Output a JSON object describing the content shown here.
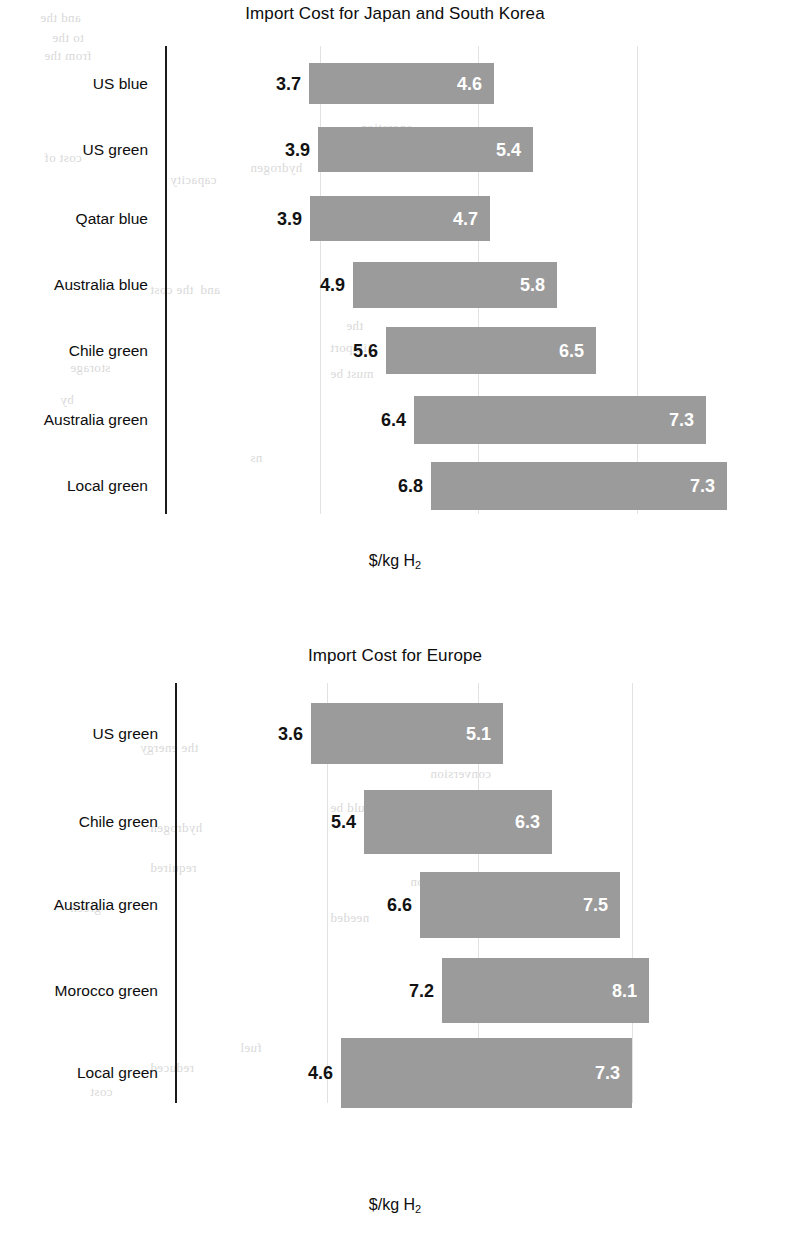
{
  "page": {
    "background_color": "#ffffff",
    "bar_color": "#9b9b9b",
    "axis_color": "#1a1a1a",
    "gridline_color": "#e2e2e2",
    "low_label_color": "#121212",
    "high_label_color": "#ffffff"
  },
  "charts": [
    {
      "title": "Import Cost for Japan and South Korea",
      "xlabel_prefix": "$/kg H",
      "xlabel_sub": "2",
      "categories": [
        "US blue",
        "US green",
        "Qatar blue",
        "Australia blue",
        "Chile green",
        "Australia green",
        "Local green"
      ],
      "low_labels": [
        "3.7",
        "3.9",
        "3.9",
        "4.9",
        "5.6",
        "6.4",
        "6.8"
      ],
      "high_labels": [
        "4.6",
        "5.4",
        "4.7",
        "5.8",
        "6.5",
        "7.3",
        "7.3"
      ]
    },
    {
      "title": "Import Cost for Europe",
      "xlabel_prefix": "$/kg H",
      "xlabel_sub": "2",
      "categories": [
        "US green",
        "Chile green",
        "Australia green",
        "Morocco green",
        "Local green"
      ],
      "low_labels": [
        "3.6",
        "5.4",
        "6.6",
        "7.2",
        "4.6"
      ],
      "high_labels": [
        "5.1",
        "6.3",
        "7.5",
        "8.1",
        "7.3"
      ]
    }
  ],
  "chart_data": [
    {
      "type": "bar",
      "orientation": "horizontal",
      "style": "floating range bars (low-high)",
      "title": "Import Cost for Japan and South Korea",
      "xlabel": "$/kg H2",
      "ylabel": "",
      "grid": "vertical gridlines only",
      "legend": "none",
      "categories": [
        "US blue",
        "US green",
        "Qatar blue",
        "Australia blue",
        "Chile green",
        "Australia green",
        "Local green"
      ],
      "low": [
        3.7,
        3.9,
        3.9,
        4.9,
        5.6,
        6.4,
        6.8
      ],
      "high": [
        4.6,
        5.4,
        4.7,
        5.8,
        6.5,
        7.3,
        7.3
      ]
    },
    {
      "type": "bar",
      "orientation": "horizontal",
      "style": "floating range bars (low-high)",
      "title": "Import Cost for Europe",
      "xlabel": "$/kg H2",
      "ylabel": "",
      "grid": "vertical gridlines only",
      "legend": "none",
      "categories": [
        "US green",
        "Chile green",
        "Australia green",
        "Morocco green",
        "Local green"
      ],
      "low": [
        3.6,
        5.4,
        6.6,
        7.2,
        4.6
      ],
      "high": [
        5.1,
        6.3,
        7.5,
        8.1,
        7.3
      ]
    }
  ],
  "layout": {
    "chart1": {
      "title_top": 4,
      "plot_top": 46,
      "plot_height": 470,
      "axis_x": 165,
      "axis_top": 46,
      "axis_height": 468,
      "label_right": 148,
      "gridlines": [
        320,
        478,
        637
      ],
      "grid_top": 46,
      "grid_height": 468,
      "xlabel_top": 552,
      "bars": [
        {
          "x": 309,
          "w": 185,
          "y": 63,
          "h": 41
        },
        {
          "x": 318,
          "w": 215,
          "y": 127,
          "h": 45
        },
        {
          "x": 310,
          "w": 180,
          "y": 196,
          "h": 45
        },
        {
          "x": 353,
          "w": 204,
          "y": 262,
          "h": 46
        },
        {
          "x": 386,
          "w": 210,
          "y": 327,
          "h": 47
        },
        {
          "x": 414,
          "w": 292,
          "y": 396,
          "h": 48
        },
        {
          "x": 431,
          "w": 296,
          "y": 462,
          "h": 48
        }
      ]
    },
    "chart2": {
      "title_top": 646,
      "plot_top": 683,
      "plot_height": 420,
      "axis_x": 175,
      "axis_top": 683,
      "axis_height": 420,
      "label_right": 158,
      "gridlines": [
        327,
        478,
        632
      ],
      "grid_top": 683,
      "grid_height": 420,
      "xlabel_top": 1196,
      "bars": [
        {
          "x": 311,
          "w": 192,
          "y": 703,
          "h": 61
        },
        {
          "x": 364,
          "w": 188,
          "y": 790,
          "h": 64
        },
        {
          "x": 420,
          "w": 200,
          "y": 872,
          "h": 66
        },
        {
          "x": 442,
          "w": 207,
          "y": 958,
          "h": 65
        },
        {
          "x": 341,
          "w": 291,
          "y": 1038,
          "h": 70
        }
      ]
    }
  },
  "bleed_text": [
    {
      "t": "and the",
      "x": 40,
      "y": 10
    },
    {
      "t": "to the",
      "x": 52,
      "y": 30
    },
    {
      "t": "from the",
      "x": 44,
      "y": 48
    },
    {
      "t": "operation",
      "x": 360,
      "y": 120
    },
    {
      "t": "of the",
      "x": 430,
      "y": 140
    },
    {
      "t": "cost of",
      "x": 44,
      "y": 150
    },
    {
      "t": "hydrogen",
      "x": 250,
      "y": 160
    },
    {
      "t": "capacity",
      "x": 170,
      "y": 172
    },
    {
      "t": "at",
      "x": 430,
      "y": 196
    },
    {
      "t": "and",
      "x": 200,
      "y": 282
    },
    {
      "t": "the cost",
      "x": 150,
      "y": 282
    },
    {
      "t": "the",
      "x": 346,
      "y": 318
    },
    {
      "t": "import",
      "x": 330,
      "y": 340
    },
    {
      "t": "storage",
      "x": 70,
      "y": 360
    },
    {
      "t": "must be",
      "x": 330,
      "y": 366
    },
    {
      "t": "for the",
      "x": 420,
      "y": 362
    },
    {
      "t": "by",
      "x": 60,
      "y": 392
    },
    {
      "t": "ns",
      "x": 250,
      "y": 450
    },
    {
      "t": "in a refinery",
      "x": 430,
      "y": 700
    },
    {
      "t": "the energy",
      "x": 140,
      "y": 740
    },
    {
      "t": "for a",
      "x": 360,
      "y": 748
    },
    {
      "t": "conversion",
      "x": 430,
      "y": 766
    },
    {
      "t": "would be",
      "x": 330,
      "y": 800
    },
    {
      "t": "hydrogen",
      "x": 150,
      "y": 820
    },
    {
      "t": "emissions",
      "x": 420,
      "y": 824
    },
    {
      "t": "required",
      "x": 150,
      "y": 860
    },
    {
      "t": "production",
      "x": 410,
      "y": 874
    },
    {
      "t": "green",
      "x": 70,
      "y": 900
    },
    {
      "t": "needed",
      "x": 330,
      "y": 910
    },
    {
      "t": "fuel",
      "x": 240,
      "y": 1040
    },
    {
      "t": "reduced",
      "x": 150,
      "y": 1060
    },
    {
      "t": "cost",
      "x": 90,
      "y": 1084
    }
  ]
}
